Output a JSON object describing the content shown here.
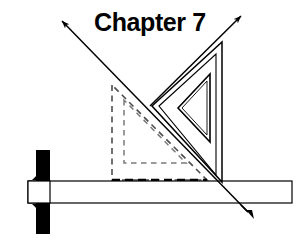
{
  "figure": {
    "title": "Chapter 7",
    "title_position": {
      "x": 94,
      "y": 31
    },
    "background_color": "#ffffff",
    "ink_color": "#000000",
    "line_color": "#1a1a1a",
    "ghost_color": "#555555",
    "instruments": {
      "tsquare": {
        "label": "t-square",
        "blade_label": "t-square-blade",
        "head_label": "t-square-head",
        "blade_fill": "#ffffff",
        "head_fill": "#000000"
      },
      "set_square": {
        "label": "45-degree-set-square",
        "state": "solid",
        "fill": "#ffffff",
        "stroke": "#000000"
      },
      "set_square_ghost": {
        "label": "45-degree-set-square-ghost",
        "state": "dashed",
        "stroke": "#4d4d4d"
      }
    },
    "arrows": [
      {
        "name": "hypotenuse-direction-arrow",
        "from": {
          "x": 248,
          "y": 212
        },
        "to": {
          "x": 57,
          "y": 16
        },
        "head": "filled"
      },
      {
        "name": "perpendicular-direction-arrow",
        "from": {
          "x": 150,
          "y": 106
        },
        "to": {
          "x": 246,
          "y": 11
        },
        "head": "filled"
      }
    ]
  }
}
